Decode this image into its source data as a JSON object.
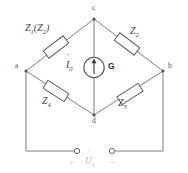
{
  "diagram": {
    "nodes": [
      {
        "id": "a",
        "label": "a",
        "x": 18,
        "y": 66
      },
      {
        "id": "b",
        "label": "b",
        "x": 170,
        "y": 66
      },
      {
        "id": "c",
        "label": "c",
        "x": 94,
        "y": 14
      },
      {
        "id": "d",
        "label": "d",
        "x": 94,
        "y": 118
      }
    ],
    "impedances": [
      {
        "id": "z1",
        "label": "Z",
        "sub": "1",
        "paren": "(Z",
        "paren_sub": "2",
        "paren_close": ")",
        "full": "Z1(Z2)",
        "arm": "a-c"
      },
      {
        "id": "z2",
        "label": "Z",
        "sub": "2",
        "full": "Z2",
        "arm": "c-b"
      },
      {
        "id": "z4",
        "label": "Z",
        "sub": "4",
        "full": "Z4",
        "arm": "a-d"
      },
      {
        "id": "z3",
        "label": "Z",
        "sub": "3",
        "full": "Z3",
        "arm": "d-b"
      }
    ],
    "galvanometer": {
      "label": "G",
      "current_symbol": "I",
      "current_sub": "0",
      "current_full": "I0",
      "arrow_direction": "up"
    },
    "source": {
      "symbol": "U",
      "sub": "s",
      "full": "Us",
      "plus": "+",
      "minus": "−"
    },
    "colors": {
      "wire": "#6e6e6e",
      "component_stroke": "#555555",
      "component_fill": "#ffffff",
      "node_dot": "#4a4a4a",
      "label": "#3f3f3f",
      "faint_label": "#bdbdbd",
      "background": "#ffffff"
    }
  }
}
